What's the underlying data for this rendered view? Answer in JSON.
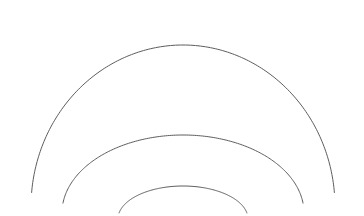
{
  "figure": {
    "title": "",
    "background_color": "#ffffff",
    "width": 364,
    "height": 216
  },
  "chart_data": {
    "type": "line",
    "title": "",
    "subtitle": "",
    "xlabel": "",
    "ylabel": "",
    "grid": false,
    "legend": false,
    "legend_position": "none",
    "axis_visible": false,
    "tick_labels_x": [],
    "tick_labels_y": [],
    "xlim": [
      0,
      364
    ],
    "ylim": [
      0,
      216
    ],
    "annotations": [],
    "series": [
      {
        "name": "outer-arc",
        "kind": "arc",
        "center_x": 183,
        "center_y": 207,
        "radius_x": 152,
        "radius_y": 162,
        "start_angle_deg": 185,
        "end_angle_deg": 355,
        "stroke_color": "#5c5c5c",
        "stroke_width": 1.0,
        "apex_x": 183,
        "apex_y": 45,
        "left_x": 31,
        "right_x": 333
      },
      {
        "name": "middle-arc",
        "kind": "arc",
        "center_x": 183,
        "center_y": 213,
        "radius_x": 121,
        "radius_y": 78,
        "start_angle_deg": 187,
        "end_angle_deg": 353,
        "stroke_color": "#5c5c5c",
        "stroke_width": 1.0,
        "apex_x": 183,
        "apex_y": 135,
        "left_x": 62,
        "right_x": 304
      },
      {
        "name": "inner-arc",
        "kind": "arc",
        "center_x": 183,
        "center_y": 219,
        "radius_x": 65,
        "radius_y": 33,
        "start_angle_deg": 190,
        "end_angle_deg": 350,
        "stroke_color": "#5c5c5c",
        "stroke_width": 1.0,
        "apex_x": 183,
        "apex_y": 186,
        "left_x": 118,
        "right_x": 248
      }
    ]
  },
  "colors": {
    "stroke": "#5c5c5c",
    "background": "#ffffff"
  }
}
